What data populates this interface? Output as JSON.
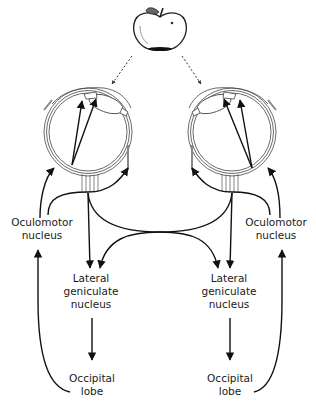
{
  "diagram": {
    "stimulus": {
      "icon": "apple-icon"
    },
    "labels": {
      "oculomotor_left": [
        "Oculomotor",
        "nucleus"
      ],
      "oculomotor_right": [
        "Oculomotor",
        "nucleus"
      ],
      "lgn_left": [
        "Lateral",
        "geniculate",
        "nucleus"
      ],
      "lgn_right": [
        "Lateral",
        "geniculate",
        "nucleus"
      ],
      "occipital_left": [
        "Occipital",
        "lobe"
      ],
      "occipital_right": [
        "Occipital",
        "lobe"
      ]
    },
    "colors": {
      "line": "#111111",
      "outline": "#444444",
      "background": "#ffffff"
    }
  }
}
